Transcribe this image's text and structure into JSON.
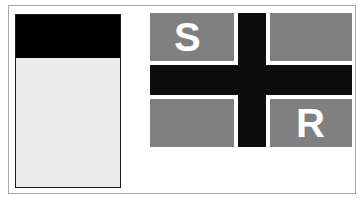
{
  "panel": {
    "header_color": "#000000",
    "body_color": "#ececec"
  },
  "flag": {
    "quadrant_color": "#808080",
    "cross_color": "#0d0d0d",
    "quadrants": [
      {
        "position": "top-left",
        "label": "S"
      },
      {
        "position": "top-right",
        "label": ""
      },
      {
        "position": "bottom-left",
        "label": ""
      },
      {
        "position": "bottom-right",
        "label": "R"
      }
    ]
  }
}
